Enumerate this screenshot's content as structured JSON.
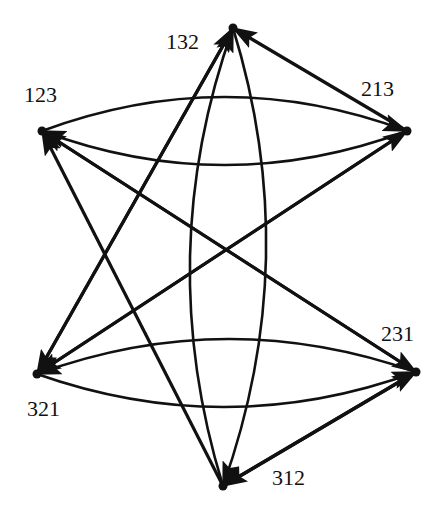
{
  "diagram": {
    "type": "directed-graph",
    "colors": {
      "background": "#ffffff",
      "stroke": "#111111"
    },
    "nodes": [
      {
        "id": "132",
        "label": "132",
        "x": 233,
        "y": 28,
        "label_x": 166,
        "label_y": 31
      },
      {
        "id": "123",
        "label": "123",
        "x": 42,
        "y": 131,
        "label_x": 24,
        "label_y": 84
      },
      {
        "id": "213",
        "label": "213",
        "x": 407,
        "y": 131,
        "label_x": 361,
        "label_y": 78
      },
      {
        "id": "321",
        "label": "321",
        "x": 37,
        "y": 374,
        "label_x": 27,
        "label_y": 398
      },
      {
        "id": "231",
        "label": "231",
        "x": 416,
        "y": 372,
        "label_x": 381,
        "label_y": 323
      },
      {
        "id": "312",
        "label": "312",
        "x": 223,
        "y": 486,
        "label_x": 272,
        "label_y": 467
      }
    ],
    "edges": [
      {
        "from": "123",
        "to": "213",
        "shape": "arc",
        "bend": -34
      },
      {
        "from": "213",
        "to": "123",
        "shape": "arc",
        "bend": -34
      },
      {
        "from": "231",
        "to": "321",
        "shape": "arc",
        "bend": 34
      },
      {
        "from": "321",
        "to": "231",
        "shape": "arc",
        "bend": 34
      },
      {
        "from": "312",
        "to": "132",
        "shape": "arc",
        "bend": -38
      },
      {
        "from": "132",
        "to": "312",
        "shape": "arc",
        "bend": -38
      },
      {
        "from": "213",
        "to": "132",
        "shape": "line"
      },
      {
        "from": "321",
        "to": "132",
        "shape": "line"
      },
      {
        "from": "132",
        "to": "321",
        "shape": "line"
      },
      {
        "from": "321",
        "to": "213",
        "shape": "line"
      },
      {
        "from": "213",
        "to": "321",
        "shape": "line"
      },
      {
        "from": "231",
        "to": "123",
        "shape": "line"
      },
      {
        "from": "123",
        "to": "231",
        "shape": "line"
      },
      {
        "from": "312",
        "to": "123",
        "shape": "line"
      },
      {
        "from": "231",
        "to": "312",
        "shape": "line"
      },
      {
        "from": "312",
        "to": "231",
        "shape": "line"
      }
    ]
  }
}
